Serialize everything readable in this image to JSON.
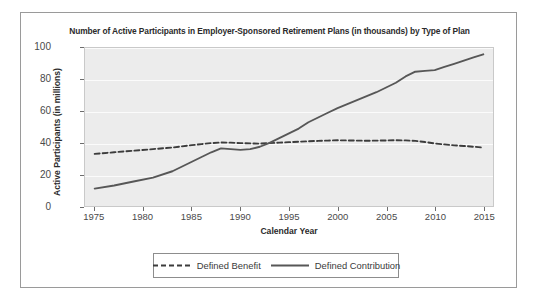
{
  "chart_data": {
    "type": "line",
    "title": "Number of Active Participants in Employer-Sponsored Retirement Plans (in thousands) by Type of Plan",
    "xlabel": "Calendar Year",
    "ylabel": "Active Participants (in millions)",
    "xlim": [
      1974,
      2016
    ],
    "ylim": [
      0,
      100
    ],
    "xticks": [
      1975,
      1980,
      1985,
      1990,
      1995,
      2000,
      2005,
      2010,
      2015
    ],
    "yticks": [
      0,
      20,
      40,
      60,
      80,
      100
    ],
    "grid": "horizontal-white-gridlines",
    "legend_position": "bottom-center-outside",
    "plot_background": "#ececec",
    "series": [
      {
        "name": "Defined Benefit",
        "style": "dashed",
        "color": "#3c3c3c",
        "x": [
          1975,
          1977,
          1979,
          1981,
          1983,
          1985,
          1986,
          1987,
          1988,
          1989,
          1990,
          1991,
          1992,
          1993,
          1994,
          1995,
          1996,
          1997,
          1998,
          1999,
          2000,
          2001,
          2002,
          2003,
          2004,
          2005,
          2006,
          2007,
          2008,
          2009,
          2010,
          2011,
          2012,
          2013,
          2014,
          2015
        ],
        "values": [
          33,
          34,
          35,
          36,
          37,
          38.5,
          39.2,
          39.8,
          40.2,
          40.1,
          39.8,
          39.6,
          39.5,
          39.8,
          40.1,
          40.4,
          40.7,
          41,
          41.2,
          41.4,
          41.6,
          41.5,
          41.4,
          41.3,
          41.4,
          41.5,
          41.6,
          41.5,
          41.2,
          40.5,
          39.6,
          39,
          38.4,
          38,
          37.5,
          37
        ]
      },
      {
        "name": "Defined Contribution",
        "style": "solid",
        "color": "#575757",
        "x": [
          1975,
          1977,
          1979,
          1981,
          1983,
          1985,
          1986,
          1987,
          1988,
          1989,
          1990,
          1991,
          1992,
          1993,
          1994,
          1995,
          1996,
          1997,
          1998,
          1999,
          2000,
          2001,
          2002,
          2003,
          2004,
          2005,
          2006,
          2007,
          2008,
          2009,
          2010,
          2011,
          2012,
          2013,
          2014,
          2015
        ],
        "values": [
          11,
          13,
          15.5,
          18,
          22,
          28,
          31,
          34,
          36.5,
          36,
          35.5,
          36,
          37.5,
          40,
          43,
          46,
          49,
          53,
          56,
          59,
          62,
          64.5,
          67,
          69.5,
          72,
          75,
          78,
          82,
          85,
          85.5,
          86,
          88,
          90,
          92,
          94,
          96
        ]
      }
    ]
  },
  "legend": {
    "items": [
      {
        "label": "Defined Benefit"
      },
      {
        "label": "Defined Contribution"
      }
    ]
  }
}
